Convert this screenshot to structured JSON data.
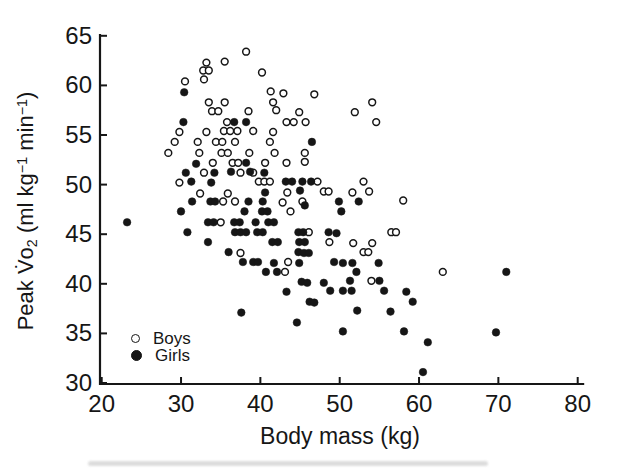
{
  "figure": {
    "background": "#ffffff",
    "ink_color": "#161616"
  },
  "legend": {
    "items": [
      {
        "label": "Boys",
        "marker": "open-circle"
      },
      {
        "label": "Girls",
        "marker": "filled-circle"
      }
    ]
  },
  "chart_data": {
    "type": "scatter",
    "title": "",
    "xlabel": "Body mass (kg)",
    "ylabel": "Peak V̇o₂ (ml kg⁻¹ min⁻¹)",
    "ylabel_parts": {
      "pre": "Peak V̇o",
      "sub": "2",
      "mid1": " (ml kg",
      "sup1": "−1",
      "mid2": " min",
      "sup2": "−1",
      "post": ")"
    },
    "xlim": [
      20,
      80
    ],
    "ylim": [
      30,
      65
    ],
    "x_ticks": [
      20,
      30,
      40,
      50,
      60,
      70,
      80
    ],
    "y_ticks": [
      30,
      35,
      40,
      45,
      50,
      55,
      60,
      65
    ],
    "grid": false,
    "legend_position": "lower-left-inside",
    "series": [
      {
        "name": "Boys",
        "marker": "open-circle",
        "fill": "#ffffff",
        "stroke": "#161616",
        "points": [
          [
            38.2,
            63.4
          ],
          [
            33.2,
            62.3
          ],
          [
            35.5,
            62.4
          ],
          [
            32.8,
            61.5
          ],
          [
            33.5,
            61.5
          ],
          [
            40.2,
            61.3
          ],
          [
            32.9,
            60.6
          ],
          [
            30.5,
            60.4
          ],
          [
            41.3,
            59.4
          ],
          [
            42.9,
            59.2
          ],
          [
            46.8,
            59.1
          ],
          [
            33.5,
            58.3
          ],
          [
            35.5,
            58.3
          ],
          [
            41.6,
            58.3
          ],
          [
            54.1,
            58.3
          ],
          [
            33.9,
            57.4
          ],
          [
            34.7,
            57.4
          ],
          [
            38.5,
            57.4
          ],
          [
            42.0,
            57.5
          ],
          [
            44.9,
            57.3
          ],
          [
            51.9,
            57.3
          ],
          [
            35.8,
            56.3
          ],
          [
            43.3,
            56.3
          ],
          [
            44.2,
            56.3
          ],
          [
            45.7,
            56.3
          ],
          [
            54.6,
            56.3
          ],
          [
            29.8,
            55.3
          ],
          [
            33.2,
            55.3
          ],
          [
            35.4,
            55.4
          ],
          [
            36.2,
            55.4
          ],
          [
            37.1,
            55.4
          ],
          [
            39.1,
            55.4
          ],
          [
            41.6,
            55.3
          ],
          [
            29.2,
            54.3
          ],
          [
            32.1,
            54.3
          ],
          [
            34.4,
            54.3
          ],
          [
            35.2,
            54.3
          ],
          [
            36.8,
            54.3
          ],
          [
            41.2,
            54.3
          ],
          [
            28.4,
            53.2
          ],
          [
            32.3,
            53.2
          ],
          [
            35.1,
            53.2
          ],
          [
            35.9,
            53.2
          ],
          [
            38.6,
            53.2
          ],
          [
            41.8,
            53.2
          ],
          [
            45.6,
            53.2
          ],
          [
            34.0,
            52.2
          ],
          [
            36.5,
            52.2
          ],
          [
            37.2,
            52.2
          ],
          [
            40.6,
            52.2
          ],
          [
            43.3,
            52.2
          ],
          [
            45.6,
            52.3
          ],
          [
            32.9,
            51.2
          ],
          [
            37.5,
            51.2
          ],
          [
            39.1,
            51.2
          ],
          [
            29.8,
            50.2
          ],
          [
            39.8,
            50.3
          ],
          [
            40.5,
            50.3
          ],
          [
            41.2,
            50.3
          ],
          [
            47.2,
            50.3
          ],
          [
            53.0,
            50.3
          ],
          [
            32.4,
            49.1
          ],
          [
            35.9,
            49.1
          ],
          [
            43.4,
            49.2
          ],
          [
            48.0,
            49.3
          ],
          [
            48.6,
            49.3
          ],
          [
            51.6,
            49.2
          ],
          [
            53.7,
            49.3
          ],
          [
            35.3,
            48.3
          ],
          [
            36.8,
            48.3
          ],
          [
            42.8,
            48.2
          ],
          [
            45.3,
            48.3
          ],
          [
            58.0,
            48.4
          ],
          [
            43.8,
            47.3
          ],
          [
            35.0,
            46.2
          ],
          [
            46.1,
            45.2
          ],
          [
            56.5,
            45.2
          ],
          [
            57.1,
            45.2
          ],
          [
            48.7,
            44.2
          ],
          [
            51.7,
            44.1
          ],
          [
            54.1,
            44.1
          ],
          [
            37.5,
            43.1
          ],
          [
            53.0,
            43.2
          ],
          [
            53.6,
            43.2
          ],
          [
            43.5,
            42.2
          ],
          [
            43.1,
            41.2
          ],
          [
            63.0,
            41.2
          ],
          [
            54.0,
            40.3
          ]
        ]
      },
      {
        "name": "Girls",
        "marker": "filled-circle",
        "fill": "#161616",
        "stroke": "#161616",
        "points": [
          [
            30.4,
            59.3
          ],
          [
            30.3,
            56.3
          ],
          [
            36.7,
            56.3
          ],
          [
            38.2,
            56.3
          ],
          [
            46.5,
            54.3
          ],
          [
            31.9,
            52.1
          ],
          [
            38.2,
            52.2
          ],
          [
            30.6,
            51.2
          ],
          [
            34.2,
            51.2
          ],
          [
            36.3,
            51.3
          ],
          [
            38.7,
            51.3
          ],
          [
            40.5,
            51.2
          ],
          [
            31.3,
            50.3
          ],
          [
            33.8,
            50.2
          ],
          [
            43.2,
            50.3
          ],
          [
            44.0,
            50.3
          ],
          [
            45.3,
            50.3
          ],
          [
            46.4,
            50.3
          ],
          [
            40.6,
            49.2
          ],
          [
            45.0,
            49.4
          ],
          [
            31.4,
            48.3
          ],
          [
            33.7,
            48.3
          ],
          [
            34.3,
            48.3
          ],
          [
            38.5,
            48.3
          ],
          [
            40.3,
            48.3
          ],
          [
            45.6,
            47.9
          ],
          [
            49.9,
            48.3
          ],
          [
            52.4,
            48.3
          ],
          [
            30.0,
            47.3
          ],
          [
            38.0,
            47.3
          ],
          [
            40.2,
            47.3
          ],
          [
            40.9,
            47.3
          ],
          [
            50.2,
            47.3
          ],
          [
            23.2,
            46.2
          ],
          [
            33.4,
            46.2
          ],
          [
            34.1,
            46.2
          ],
          [
            36.7,
            46.2
          ],
          [
            37.4,
            46.2
          ],
          [
            39.4,
            46.2
          ],
          [
            41.0,
            46.2
          ],
          [
            41.7,
            46.2
          ],
          [
            30.8,
            45.2
          ],
          [
            36.8,
            45.2
          ],
          [
            37.5,
            45.2
          ],
          [
            38.2,
            45.2
          ],
          [
            39.6,
            45.2
          ],
          [
            40.3,
            45.2
          ],
          [
            44.8,
            45.2
          ],
          [
            45.4,
            45.2
          ],
          [
            48.6,
            45.2
          ],
          [
            49.6,
            45.1
          ],
          [
            33.4,
            44.2
          ],
          [
            41.5,
            44.2
          ],
          [
            42.2,
            44.2
          ],
          [
            44.9,
            44.2
          ],
          [
            45.6,
            44.2
          ],
          [
            36.0,
            43.2
          ],
          [
            44.8,
            43.2
          ],
          [
            45.5,
            43.1
          ],
          [
            46.1,
            43.1
          ],
          [
            37.8,
            42.2
          ],
          [
            39.1,
            42.2
          ],
          [
            39.7,
            42.2
          ],
          [
            41.7,
            42.1
          ],
          [
            44.9,
            42.1
          ],
          [
            49.3,
            42.2
          ],
          [
            50.4,
            42.1
          ],
          [
            51.6,
            42.1
          ],
          [
            54.9,
            42.1
          ],
          [
            40.7,
            41.2
          ],
          [
            42.1,
            41.2
          ],
          [
            52.1,
            41.2
          ],
          [
            71.0,
            41.2
          ],
          [
            45.2,
            40.2
          ],
          [
            45.9,
            40.1
          ],
          [
            48.0,
            40.1
          ],
          [
            51.3,
            40.3
          ],
          [
            55.0,
            40.3
          ],
          [
            43.3,
            39.2
          ],
          [
            48.8,
            39.3
          ],
          [
            50.4,
            39.3
          ],
          [
            51.5,
            39.3
          ],
          [
            55.6,
            39.3
          ],
          [
            58.4,
            39.2
          ],
          [
            46.2,
            38.2
          ],
          [
            46.8,
            38.1
          ],
          [
            59.2,
            38.2
          ],
          [
            37.6,
            37.1
          ],
          [
            52.2,
            37.3
          ],
          [
            56.4,
            37.2
          ],
          [
            44.6,
            36.1
          ],
          [
            50.4,
            35.2
          ],
          [
            58.1,
            35.2
          ],
          [
            69.7,
            35.1
          ],
          [
            61.1,
            34.1
          ],
          [
            60.5,
            31.1
          ]
        ]
      }
    ]
  }
}
